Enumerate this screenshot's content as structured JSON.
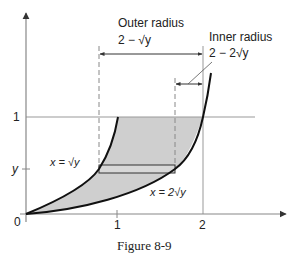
{
  "figure": {
    "caption": "Figure 8-9",
    "axes": {
      "x_ticks": [
        "1",
        "2"
      ],
      "y_ticks": [
        "1",
        "y"
      ],
      "origin_label": "0"
    },
    "annotations": {
      "outer_radius_title": "Outer radius",
      "outer_radius_expr": "2 − √y",
      "inner_radius_title": "Inner radius",
      "inner_radius_expr": "2 − 2√y",
      "left_curve_label": "x = √y",
      "right_curve_label": "x = 2√y"
    },
    "colors": {
      "shade": "#cfcfcf",
      "curve": "#111111",
      "axis": "#888888"
    }
  }
}
